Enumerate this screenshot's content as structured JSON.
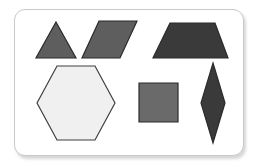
{
  "scene": {
    "title": "Geometric shapes card",
    "background_color": "#ffffff",
    "card": {
      "name": "shape-card",
      "fill": "#ffffff",
      "border_color": "#c9c9c9",
      "corner_radius": 11,
      "x": 14,
      "y": 9,
      "width": 230,
      "height": 147
    }
  },
  "palette": {
    "medium_gray": "#5e5e5e",
    "medium_gray_light": "#6a6a6a",
    "dark_charcoal": "#3a3a3a",
    "near_white": "#f0f0f0",
    "outline_dark": "#2b2b2b",
    "outline_mid": "#3f3f3f"
  },
  "shapes": [
    {
      "id": "triangle",
      "label": "Triangle",
      "sides": 3,
      "row": 1,
      "column": 1,
      "fill": "#5e5e5e",
      "stroke": "#2b2b2b",
      "points": "56,22 76,58 36,58"
    },
    {
      "id": "parallelogram",
      "label": "Parallelogram",
      "sides": 4,
      "row": 1,
      "column": 2,
      "fill": "#5e5e5e",
      "stroke": "#2b2b2b",
      "points": "99,21 137,21 120,58 82,58"
    },
    {
      "id": "trapezoid",
      "label": "Trapezoid",
      "sides": 4,
      "row": 1,
      "column": 3,
      "fill": "#3a3a3a",
      "stroke": "#2b2b2b",
      "points": "170,23 215,23 228,58 153,58"
    },
    {
      "id": "hexagon",
      "label": "Hexagon",
      "sides": 6,
      "row": 2,
      "column": 1,
      "fill": "#f0f0f0",
      "stroke": "#3f3f3f",
      "points": "57,66 95,66 115,103 95,140 57,140 37,103"
    },
    {
      "id": "square",
      "label": "Square",
      "sides": 4,
      "row": 2,
      "column": 2,
      "fill": "#6a6a6a",
      "stroke": "#2b2b2b",
      "points": "139,83 178,83 178,122 139,122"
    },
    {
      "id": "rhombus",
      "label": "Rhombus",
      "sides": 4,
      "row": 2,
      "column": 3,
      "fill": "#3a3a3a",
      "stroke": "#2b2b2b",
      "points": "213,63 225,103 213,143 201,103"
    }
  ]
}
